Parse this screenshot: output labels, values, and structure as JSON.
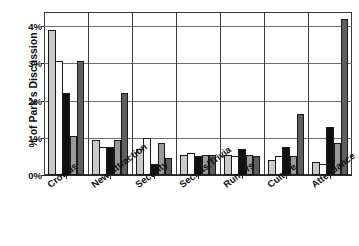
{
  "chart_data": {
    "type": "bar",
    "title": "",
    "subtitle": "",
    "xlabel": "",
    "ylabel": "% of Park's Discussion",
    "ylim": [
      0,
      4.35
    ],
    "ytick_values": [
      0,
      1,
      2,
      3,
      4
    ],
    "ytick_labels": [
      "0%",
      "1%",
      "2%",
      "3%",
      "4%"
    ],
    "grid": true,
    "grid_axis": "y",
    "legend": false,
    "legend_position": "none",
    "categories": [
      "Crowds",
      "New Attraction",
      "Security",
      "Secrets/Trivia",
      "Rumors",
      "Culture",
      "Attendance"
    ],
    "series": [
      {
        "name": "series-1",
        "fill": "#c9c9c9",
        "values": [
          3.9,
          0.95,
          0.7,
          0.55,
          0.55,
          0.4,
          0.35
        ]
      },
      {
        "name": "series-2",
        "fill": "#ffffff",
        "values": [
          3.05,
          0.75,
          1.0,
          0.6,
          0.5,
          0.5,
          0.3
        ]
      },
      {
        "name": "series-3",
        "fill": "#111111",
        "values": [
          2.2,
          0.75,
          0.3,
          0.5,
          0.7,
          0.75,
          1.3
        ]
      },
      {
        "name": "series-4",
        "fill": "#9a9a9a",
        "values": [
          1.05,
          0.95,
          0.85,
          0.55,
          0.55,
          0.5,
          0.85
        ]
      },
      {
        "name": "series-5",
        "fill": "#5e5e5e",
        "values": [
          3.05,
          2.2,
          0.45,
          0.55,
          0.5,
          1.65,
          4.2
        ]
      }
    ],
    "axis_color": "#3a3a3a",
    "grid_color": "#6e6e6e",
    "background": "#ffffff"
  }
}
